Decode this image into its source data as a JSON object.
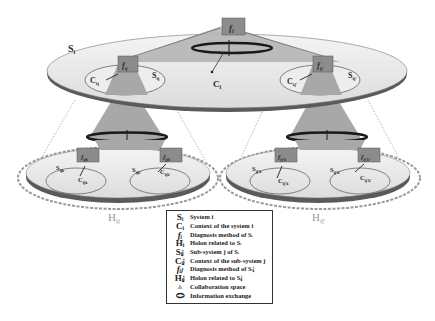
{
  "diagram": {
    "top_system": {
      "label": "S",
      "label_sub": "i",
      "function_label": "f",
      "function_sub": "i",
      "context_label": "C",
      "context_sub": "i"
    },
    "subsystems": [
      {
        "function": "f",
        "function_sub": "ij",
        "system": "S",
        "system_sub": "ij",
        "context": "C",
        "context_sub": "ij"
      },
      {
        "function": "f",
        "function_sub": "ij'",
        "system": "S",
        "system_sub": "ij'",
        "context": "C",
        "context_sub": "ij'"
      }
    ],
    "holons": [
      {
        "label": "H",
        "label_sub": "ij",
        "units": [
          {
            "function": "f",
            "function_sub": "ijk",
            "system": "S",
            "system_sub": "ijk",
            "context": "C",
            "context_sub": "ijk"
          },
          {
            "function": "f",
            "function_sub": "ijk'",
            "system": "S",
            "system_sub": "ijk'",
            "context": "C",
            "context_sub": "ijk'"
          }
        ]
      },
      {
        "label": "H",
        "label_sub": "ij'",
        "units": [
          {
            "function": "f",
            "function_sub": "ij'k",
            "system": "S",
            "system_sub": "ij'k",
            "context": "C",
            "context_sub": "ij'k"
          },
          {
            "function": "f",
            "function_sub": "ij'k'",
            "system": "S",
            "system_sub": "ij'k'",
            "context": "C",
            "context_sub": "ij'k'"
          }
        ]
      }
    ]
  },
  "legend": {
    "items": [
      {
        "symbol": "Sᵢ",
        "text": "System i"
      },
      {
        "symbol": "Cᵢ",
        "text": "Context of the system i"
      },
      {
        "symbol": "fᵢ",
        "text": "Diagnosis method of Sᵢ"
      },
      {
        "symbol": "Hᵢ",
        "text": "Holon related to Sᵢ"
      },
      {
        "symbol": "Sᵢⱼ",
        "text": "Sub-system j of Sᵢ"
      },
      {
        "symbol": "Cᵢⱼ",
        "text": "Context of the sub-system j"
      },
      {
        "symbol": "fᵢⱼ",
        "text": "Diagnosis method of Sᵢⱼ"
      },
      {
        "symbol": "Hᵢⱼ",
        "text": "Holon related to Sᵢⱼ"
      },
      {
        "symbol": "▲",
        "text": "Collaboration space"
      },
      {
        "symbol": "⬭",
        "text": "Information exchange"
      }
    ]
  },
  "colors": {
    "disk_fill": "#e9e9e9",
    "disk_edge": "#555555",
    "collab_space": "#a8a8a8",
    "function_box": "#8c8c8c",
    "ring": "#1a1a1a",
    "holon_dash": "#9a9a9a"
  }
}
